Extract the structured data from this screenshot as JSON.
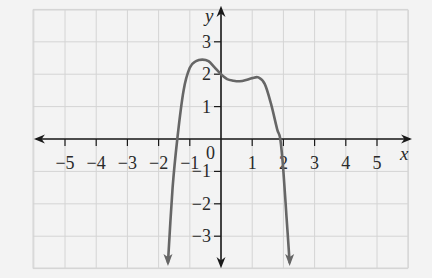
{
  "chart_data": {
    "type": "line",
    "title": "",
    "xlabel": "x",
    "ylabel": "y",
    "xlim": [
      -6,
      6
    ],
    "ylim": [
      -4,
      4
    ],
    "grid": true,
    "x_ticks": [
      -5,
      -4,
      -3,
      -2,
      -1,
      1,
      2,
      3,
      4,
      5
    ],
    "y_ticks": [
      -3,
      -2,
      -1,
      1,
      2,
      3
    ],
    "x_tick_labels": [
      "−5",
      "−4",
      "−3",
      "−2",
      "−1",
      "1",
      "2",
      "3",
      "4",
      "5"
    ],
    "y_tick_labels": [
      "−3",
      "−2",
      "−1",
      "1",
      "2",
      "3"
    ],
    "origin_label": "0",
    "series": [
      {
        "name": "f(x)",
        "color": "#666666",
        "end_arrows": "both-down",
        "x": [
          -1.7,
          -1.55,
          -1.4,
          -1.2,
          -1.0,
          -0.8,
          -0.6,
          -0.4,
          -0.2,
          0.0,
          0.2,
          0.4,
          0.6,
          0.8,
          1.0,
          1.2,
          1.4,
          1.6,
          1.8,
          1.9,
          2.0,
          2.1,
          2.2
        ],
        "y": [
          -3.8,
          -1.5,
          0.0,
          1.5,
          2.2,
          2.4,
          2.45,
          2.4,
          2.2,
          2.0,
          1.85,
          1.8,
          1.78,
          1.82,
          1.88,
          1.9,
          1.7,
          1.1,
          0.3,
          0.0,
          -1.0,
          -2.4,
          -3.8
        ]
      }
    ],
    "key_points": {
      "local_max_left": [
        -0.6,
        2.45
      ],
      "y_intercept": [
        0,
        2
      ],
      "local_min": [
        0.6,
        1.78
      ],
      "local_max_right": [
        1.2,
        1.9
      ],
      "x_intercepts": [
        -1.4,
        1.9
      ]
    }
  },
  "labels": {
    "x_axis": "x",
    "y_axis": "y",
    "origin": "0"
  },
  "colors": {
    "background": "#f3f3f3",
    "grid": "#d4d4d4",
    "axis": "#1a1a1a",
    "curve": "#666666",
    "text": "#2a2a2a"
  }
}
